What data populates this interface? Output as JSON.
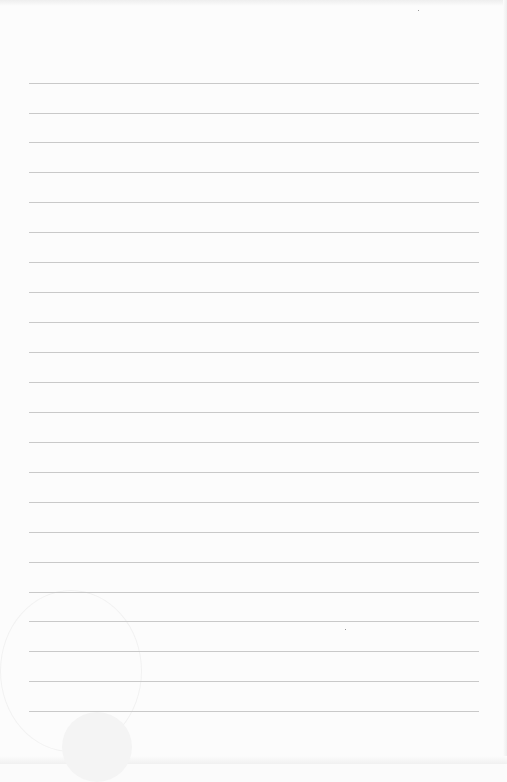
{
  "document": {
    "type": "lined-paper",
    "content": "",
    "line_count": 22,
    "line_color": "#c9c9c9",
    "background_color": "#fcfcfc",
    "lines_y": [
      83,
      113,
      142,
      172,
      202,
      232,
      262,
      292,
      322,
      352,
      382,
      412,
      442,
      472,
      502,
      532,
      562,
      592,
      621,
      651,
      681,
      711
    ]
  }
}
